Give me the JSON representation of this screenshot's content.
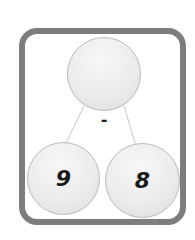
{
  "diagram": {
    "type": "number-bond",
    "whole": {
      "value": ""
    },
    "operator": "-",
    "parts": [
      {
        "value": "9"
      },
      {
        "value": "8"
      }
    ],
    "colors": {
      "frame": "#7d7d7d",
      "circle_fill": "#ececec",
      "circle_border": "#b9b9b9",
      "connector": "#c8c8c8",
      "text": "#1a1a1a"
    }
  }
}
